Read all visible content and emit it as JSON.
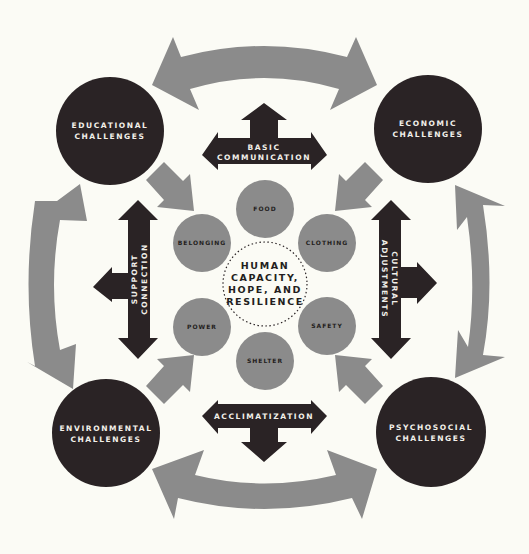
{
  "colors": {
    "background": "#fbfbf5",
    "dark": "#2a2325",
    "gray": "#8b8b8b",
    "light_text": "#f2f0ea",
    "dark_text": "#231e20"
  },
  "center": {
    "lines": [
      "HUMAN",
      "CAPACITY,",
      "HOPE, AND",
      "RESILIENCE"
    ]
  },
  "needs": [
    {
      "id": "food",
      "label": "FOOD"
    },
    {
      "id": "belonging",
      "label": "BELONGING"
    },
    {
      "id": "clothing",
      "label": "CLOTHING"
    },
    {
      "id": "power",
      "label": "POWER"
    },
    {
      "id": "safety",
      "label": "SAFETY"
    },
    {
      "id": "shelter",
      "label": "SHELTER"
    }
  ],
  "challenges": [
    {
      "id": "educational",
      "line1": "EDUCATIONAL",
      "line2": "CHALLENGES"
    },
    {
      "id": "economic",
      "line1": "ECONOMIC",
      "line2": "CHALLENGES"
    },
    {
      "id": "environmental",
      "line1": "ENVIRONMENTAL",
      "line2": "CHALLENGES"
    },
    {
      "id": "psychosocial",
      "line1": "PSYCHOSOCIAL",
      "line2": "CHALLENGES"
    }
  ],
  "responses": {
    "top": {
      "line1": "BASIC",
      "line2": "COMMUNICATION"
    },
    "left": {
      "line1": "SUPPORT",
      "line2": "CONNECTION"
    },
    "right": {
      "line1": "CULTURAL",
      "line2": "ADJUSTMENTS"
    },
    "bottom": {
      "line1": "ACCLIMATIZATION"
    }
  }
}
